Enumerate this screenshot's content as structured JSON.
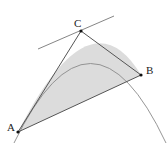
{
  "diagram": {
    "type": "parabolic-segment-with-inscribed-triangle",
    "points": {
      "A": {
        "label": "A",
        "x": 18,
        "y": 132
      },
      "B": {
        "label": "B",
        "x": 141,
        "y": 75
      },
      "C": {
        "label": "C",
        "x": 81,
        "y": 31
      }
    },
    "tangent_at": "C",
    "colors": {
      "fill": "#dcdcdc",
      "curve": "#8a8a8a",
      "lines": "#555555",
      "points": "#111111",
      "tangent": "#777777"
    }
  }
}
